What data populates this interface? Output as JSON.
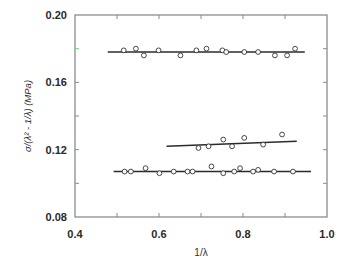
{
  "chart_data": {
    "type": "scatter",
    "title": "",
    "xlabel": "1/λ",
    "ylabel": "σ/(λ² - 1/λ) (MPa)",
    "xlim": [
      0.4,
      1.0
    ],
    "ylim": [
      0.08,
      0.2
    ],
    "x_ticks": [
      0.4,
      0.6,
      0.8,
      1.0
    ],
    "x_tick_labels": [
      "0.4",
      "0.6",
      "0.8",
      "1.0"
    ],
    "x_minor_ticks": [
      0.5,
      0.7,
      0.9
    ],
    "y_ticks": [
      0.08,
      0.12,
      0.16,
      0.2
    ],
    "y_tick_labels": [
      "0.08",
      "0.12",
      "0.16",
      "0.20"
    ],
    "y_minor_ticks": [
      0.1,
      0.14,
      0.18
    ],
    "grid": false,
    "legend": null,
    "marker": "open-circle",
    "series": [
      {
        "name": "upper",
        "x": [
          0.516,
          0.545,
          0.564,
          0.599,
          0.651,
          0.689,
          0.713,
          0.751,
          0.76,
          0.803,
          0.836,
          0.876,
          0.905,
          0.924
        ],
        "y": [
          0.179,
          0.18,
          0.176,
          0.179,
          0.176,
          0.179,
          0.18,
          0.179,
          0.178,
          0.178,
          0.178,
          0.176,
          0.176,
          0.18
        ],
        "fit_line": {
          "x": [
            0.478,
            0.947
          ],
          "y": [
            0.178,
            0.178
          ]
        }
      },
      {
        "name": "middle",
        "x": [
          0.694,
          0.718,
          0.753,
          0.774,
          0.803,
          0.848,
          0.893
        ],
        "y": [
          0.121,
          0.122,
          0.126,
          0.122,
          0.127,
          0.123,
          0.129
        ],
        "fit_line": {
          "x": [
            0.618,
            0.928
          ],
          "y": [
            0.122,
            0.125
          ]
        }
      },
      {
        "name": "lower",
        "x": [
          0.518,
          0.533,
          0.568,
          0.601,
          0.635,
          0.668,
          0.68,
          0.725,
          0.753,
          0.779,
          0.793,
          0.824,
          0.836,
          0.874,
          0.919
        ],
        "y": [
          0.107,
          0.107,
          0.109,
          0.106,
          0.107,
          0.107,
          0.107,
          0.11,
          0.106,
          0.107,
          0.109,
          0.107,
          0.108,
          0.107,
          0.107
        ],
        "fit_line": {
          "x": [
            0.492,
            0.962
          ],
          "y": [
            0.107,
            0.107
          ]
        }
      }
    ],
    "colors": {
      "frame": "#8c8c8c",
      "line": "#2b2b2b",
      "marker": "#333333",
      "highlight_tick": "#7fcf7f"
    }
  }
}
